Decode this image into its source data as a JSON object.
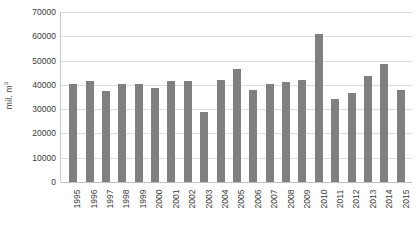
{
  "chart_data": {
    "type": "bar",
    "title": "",
    "subtitle": "",
    "xlabel": "",
    "ylabel": "mil. m3",
    "ylabel_display": "mil. m",
    "ylabel_superscript": "3",
    "ylim": [
      0,
      70000
    ],
    "ytick_step": 10000,
    "yticks": [
      70000,
      60000,
      50000,
      40000,
      30000,
      20000,
      10000,
      0
    ],
    "ytick_labels": [
      "70000",
      "60000",
      "50000",
      "40000",
      "30000",
      "20000",
      "10000",
      "0"
    ],
    "grid": true,
    "grid_axis": "y",
    "legend": false,
    "legend_position": "none",
    "bar_color": "#808080",
    "grid_color": "#DEDEDE",
    "axis_color": "#BFBFBF",
    "background": "#FFFFFF",
    "xtick_rotation": 90,
    "categories": [
      "1995",
      "1996",
      "1997",
      "1998",
      "1999",
      "2000",
      "2001",
      "2002",
      "2003",
      "2004",
      "2005",
      "2006",
      "2007",
      "2008",
      "2009",
      "2010",
      "2011",
      "2012",
      "2013",
      "2014",
      "2015"
    ],
    "values": [
      40500,
      41500,
      37500,
      40200,
      40400,
      38800,
      41800,
      41500,
      29000,
      42000,
      46500,
      37800,
      40500,
      41000,
      42200,
      61000,
      34000,
      36500,
      43500,
      48500,
      37800
    ]
  }
}
